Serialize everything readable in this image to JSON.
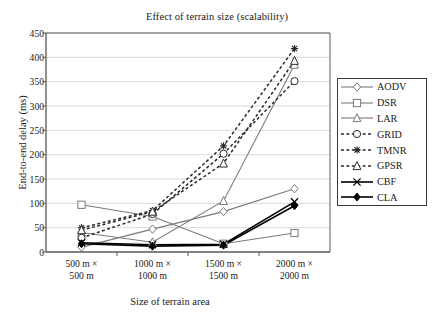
{
  "chart_data": {
    "type": "line",
    "title": "Effect of terrain size (scalability)",
    "xlabel": "Size of terrain area",
    "ylabel": "End-to-end delay (ms)",
    "categories": [
      "500 m ×\n500 m",
      "1000 m ×\n1000 m",
      "1500 m ×\n1500 m",
      "2000 m ×\n2000 m"
    ],
    "category_lines": [
      [
        "500 m ×",
        "500 m"
      ],
      [
        "1000 m ×",
        "1000 m"
      ],
      [
        "1500 m ×",
        "1500 m"
      ],
      [
        "2000 m ×",
        "2000 m"
      ]
    ],
    "ylim": [
      0,
      450
    ],
    "yticks": [
      450,
      400,
      350,
      300,
      250,
      200,
      150,
      100,
      50,
      0
    ],
    "grid": true,
    "legend_position": "right",
    "series": [
      {
        "name": "AODV",
        "values": [
          10,
          47,
          83,
          130
        ],
        "marker": "diamond-open",
        "dash": "solid",
        "color": "#7a7a7a"
      },
      {
        "name": "DSR",
        "values": [
          97,
          73,
          17,
          39
        ],
        "marker": "square-open",
        "dash": "solid",
        "color": "#7a7a7a"
      },
      {
        "name": "LAR",
        "values": [
          40,
          20,
          105,
          385
        ],
        "marker": "triangle-open",
        "dash": "solid",
        "color": "#7a7a7a"
      },
      {
        "name": "GRID",
        "values": [
          29,
          78,
          202,
          351
        ],
        "marker": "circle-open",
        "dash": "dashed",
        "color": "#2a2a2a"
      },
      {
        "name": "TMNR",
        "values": [
          50,
          85,
          218,
          418
        ],
        "marker": "asterisk",
        "dash": "dashed",
        "color": "#2a2a2a"
      },
      {
        "name": "GPSR",
        "values": [
          45,
          83,
          182,
          393
        ],
        "marker": "triangle-open",
        "dash": "dashed",
        "color": "#2a2a2a"
      },
      {
        "name": "CBF",
        "values": [
          19,
          15,
          16,
          103
        ],
        "marker": "x-cross",
        "dash": "solid",
        "color": "#000000"
      },
      {
        "name": "CLA",
        "values": [
          17,
          12,
          14,
          95
        ],
        "marker": "diamond-filled",
        "dash": "solid",
        "color": "#000000"
      }
    ]
  },
  "colors": {
    "grid": "#d9d9d9",
    "axis": "#595959",
    "plot_border": "#595959",
    "background": "#ffffff",
    "text": "#1a1a1a",
    "gray_series": "#7a7a7a",
    "dark_series": "#2a2a2a",
    "black_series": "#000000"
  }
}
